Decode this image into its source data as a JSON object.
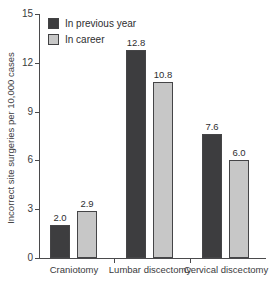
{
  "chart_data": {
    "type": "bar",
    "categories": [
      "Craniotomy",
      "Lumbar discectomy",
      "Cervical discectomy"
    ],
    "series": [
      {
        "name": "In previous year",
        "values": [
          2.0,
          12.8,
          7.6
        ],
        "color": "#3d3d3f"
      },
      {
        "name": "In career",
        "values": [
          2.9,
          10.8,
          6.0
        ],
        "color": "#c7c7c7"
      }
    ],
    "title": "",
    "xlabel": "",
    "ylabel": "Incorrect site surgeries per 10,000 cases",
    "ylim": [
      0,
      15
    ],
    "yticks": [
      0,
      3,
      6,
      9,
      12,
      15
    ],
    "value_labels": true,
    "legend_position": "top-left",
    "grid": false,
    "axis_color": "#4a4a4c",
    "background_color": "#ffffff"
  }
}
